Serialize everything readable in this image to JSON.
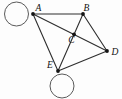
{
  "diagram": {
    "type": "graph",
    "background": "#fdfdfd",
    "edge_color": "#2e2e2e",
    "edge_width": 1.1,
    "loop_color": "#5a5a5a",
    "loop_width": 1,
    "node_color": "#141414",
    "node_radius": 1.9,
    "label_color": "#111111",
    "nodes": [
      {
        "id": "A",
        "label": "A",
        "x": 33,
        "y": 14,
        "label_x": 38.5,
        "label_y": 11
      },
      {
        "id": "B",
        "label": "B",
        "x": 83,
        "y": 14,
        "label_x": 86.5,
        "label_y": 11
      },
      {
        "id": "C",
        "label": "C",
        "x": 74,
        "y": 34.3,
        "label_x": 71.5,
        "label_y": 43
      },
      {
        "id": "D",
        "label": "D",
        "x": 107,
        "y": 51,
        "label_x": 115,
        "label_y": 55
      },
      {
        "id": "E",
        "label": "E",
        "x": 58,
        "y": 71,
        "label_x": 50,
        "label_y": 68
      }
    ],
    "edges": [
      [
        "A",
        "B"
      ],
      [
        "A",
        "D"
      ],
      [
        "A",
        "E"
      ],
      [
        "B",
        "D"
      ],
      [
        "B",
        "E"
      ],
      [
        "E",
        "D"
      ]
    ],
    "self_loops": [
      {
        "node": "A",
        "cx": 16.5,
        "cy": 14,
        "r": 12
      },
      {
        "node": "E",
        "cx": 62,
        "cy": 86,
        "r": 12
      }
    ]
  }
}
